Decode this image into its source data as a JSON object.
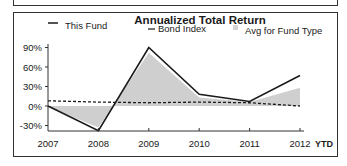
{
  "chart_data": {
    "type": "line",
    "title": "Annualized Total Return",
    "xlabel": "",
    "ylabel": "",
    "categories": [
      "2007",
      "2008",
      "2009",
      "2010",
      "2011",
      "2012"
    ],
    "x_suffix_label": "YTD",
    "ylim": [
      -35,
      95
    ],
    "y_ticks": [
      "90%",
      "60%",
      "30%",
      "0%",
      "-30%"
    ],
    "y_tick_values": [
      90,
      60,
      30,
      0,
      -30
    ],
    "grid": false,
    "legend_position": "top",
    "series": [
      {
        "name": "This Fund",
        "style": "solid-line",
        "color": "#1a1a1a",
        "values": [
          0,
          -38,
          90,
          18,
          7,
          47
        ]
      },
      {
        "name": "Bond Index",
        "style": "dashed-line",
        "color": "#1a1a1a",
        "values": [
          8,
          6,
          5,
          6,
          5,
          0
        ]
      },
      {
        "name": "Avg for Fund Type",
        "style": "area",
        "color": "#c8c8c8",
        "values": [
          -1,
          -33,
          82,
          13,
          6,
          28
        ]
      }
    ]
  },
  "legend": {
    "this_fund": "This Fund",
    "bond_index": "Bond Index",
    "avg_fund_type": "Avg for Fund Type"
  },
  "colors": {
    "line": "#1a1a1a",
    "area_fill": "#cfcfcf",
    "frame": "#333333"
  }
}
